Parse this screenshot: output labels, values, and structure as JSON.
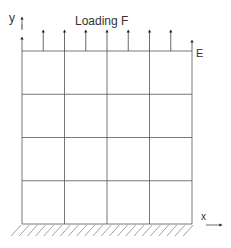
{
  "diagram": {
    "type": "structural-mesh",
    "labels": {
      "loading": "Loading F",
      "edge": "E",
      "y_axis": "y",
      "x_axis": "x"
    },
    "mesh": {
      "columns": 4,
      "rows": 4
    },
    "load_arrows": 9,
    "support": "fixed-base-hatched",
    "colors": {
      "line": "#555555",
      "text": "#333333"
    }
  }
}
